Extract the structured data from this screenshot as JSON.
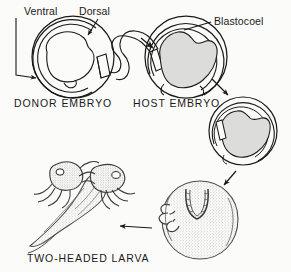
{
  "figure": {
    "domain": "Diagram",
    "width": 291,
    "height": 272,
    "background_color": "#fbfbf9",
    "ink_color": "#1a1a1a",
    "fill_gray": "#d9d9d9",
    "fill_gray_light": "#e8e8e6",
    "stipple_color": "#6e6e6e"
  },
  "labels": {
    "ventral": "Ventral",
    "dorsal": "Dorsal",
    "blastocoel": "Blastocoel"
  },
  "captions": {
    "donor_embryo": "DONOR EMBRYO",
    "host_embryo": "HOST EMBRYO",
    "two_headed_larva": "TWO-HEADED LARVA"
  },
  "stages": [
    {
      "id": "donor-embryo",
      "caption": "DONOR EMBRYO",
      "order": 1,
      "center": [
        73,
        57
      ],
      "radius": 41,
      "filled": false,
      "has_graft_excision": true,
      "pointer_labels": [
        "Ventral",
        "Dorsal"
      ]
    },
    {
      "id": "host-embryo",
      "caption": "HOST EMBRYO",
      "order": 2,
      "center": [
        186,
        57
      ],
      "radius": 41,
      "filled": true,
      "has_graft_insertion": true,
      "pointer_labels": [
        "Blastocoel"
      ]
    },
    {
      "id": "grafted-embryo",
      "caption": "",
      "order": 3,
      "center": [
        243,
        131
      ],
      "radius": 34,
      "filled": true,
      "has_graft_insertion": true,
      "pointer_labels": []
    },
    {
      "id": "neurula-stage",
      "caption": "",
      "order": 4,
      "center": [
        200,
        218
      ],
      "radius": 38,
      "filled": false,
      "stippled": true,
      "pointer_labels": []
    },
    {
      "id": "two-headed-larva",
      "caption": "TWO-HEADED LARVA",
      "order": 5,
      "center": [
        68,
        195
      ],
      "filled": false,
      "stippled": true,
      "pointer_labels": []
    }
  ],
  "arrows": [
    {
      "id": "graft-transfer-arrow",
      "from": "donor-embryo",
      "to": "host-embryo",
      "style": "curved-tube"
    },
    {
      "id": "host-to-grafted-arrow",
      "from": "host-embryo",
      "to": "grafted-embryo",
      "style": "straight",
      "direction": "down-right"
    },
    {
      "id": "grafted-to-neurula-arrow",
      "from": "grafted-embryo",
      "to": "neurula-stage",
      "style": "straight",
      "direction": "down-left"
    },
    {
      "id": "neurula-to-larva-arrow",
      "from": "neurula-stage",
      "to": "two-headed-larva",
      "style": "straight",
      "direction": "left"
    },
    {
      "id": "ventral-pointer-arrow",
      "from": "ventral-label",
      "to": "donor-embryo",
      "style": "leader",
      "direction": "right"
    },
    {
      "id": "dorsal-pointer-arrow",
      "from": "dorsal-label",
      "to": "donor-embryo",
      "style": "leader",
      "direction": "down-left"
    },
    {
      "id": "blastocoel-pointer-line",
      "from": "blastocoel-label",
      "to": "host-embryo",
      "style": "leader",
      "direction": "left"
    },
    {
      "id": "insertion-arrow",
      "from": "graft-transfer-arrow",
      "to": "host-embryo",
      "style": "arrowhead",
      "direction": "down-right"
    }
  ]
}
